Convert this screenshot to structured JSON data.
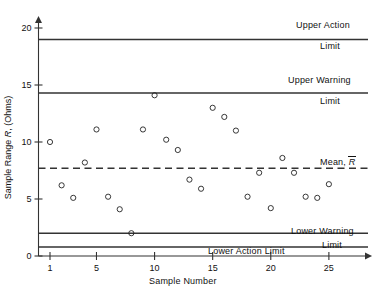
{
  "chart_data": {
    "type": "scatter",
    "title": "",
    "xlabel": "Sample Number",
    "ylabel": "Sample Range R, (Ohms)",
    "ylabel_parts": {
      "prefix": "Sample Range ",
      "symbol": "R",
      "suffix": ", (Ohms)"
    },
    "xlim": [
      0,
      27
    ],
    "ylim": [
      0,
      21
    ],
    "xticks": [
      1,
      5,
      10,
      15,
      20,
      25
    ],
    "yticks": [
      0,
      5,
      10,
      15,
      20
    ],
    "grid": false,
    "legend": false,
    "marker": "open-circle",
    "x": [
      1,
      2,
      3,
      4,
      5,
      6,
      7,
      8,
      9,
      10,
      11,
      12,
      13,
      14,
      15,
      16,
      17,
      18,
      19,
      20,
      21,
      22,
      23,
      24,
      25
    ],
    "values": [
      10.0,
      6.2,
      5.1,
      8.2,
      11.1,
      5.2,
      4.1,
      2.0,
      11.1,
      14.1,
      10.2,
      9.3,
      6.7,
      5.9,
      13.0,
      12.2,
      11.0,
      5.2,
      7.3,
      4.2,
      8.6,
      7.3,
      5.2,
      5.1,
      6.3
    ],
    "control_lines": [
      {
        "name": "upper-action-limit",
        "value": 19.0,
        "style": "solid",
        "label_line1": "Upper Action",
        "label_line2": "Limit"
      },
      {
        "name": "upper-warning-limit",
        "value": 14.3,
        "style": "solid",
        "label_line1": "Upper Warning",
        "label_line2": "Limit"
      },
      {
        "name": "mean-line",
        "value": 7.7,
        "style": "dashed",
        "label_line1": "Mean,",
        "label_symbol": "R",
        "label_line2": ""
      },
      {
        "name": "lower-warning-limit",
        "value": 2.0,
        "style": "solid",
        "label_line1": "Lower Warning",
        "label_line2": "Limit"
      },
      {
        "name": "lower-action-limit",
        "value": 0.8,
        "style": "solid",
        "label_line1": "Lower Action Limit",
        "label_line2": ""
      }
    ]
  },
  "labels": {
    "upper_action_l1": "Upper Action",
    "upper_action_l2": "Limit",
    "upper_warning_l1": "Upper Warning",
    "upper_warning_l2": "Limit",
    "mean_text": "Mean,",
    "mean_symbol": "R",
    "lower_warning_l1": "Lower Warning",
    "lower_warning_l2": "Limit",
    "lower_action": "Lower Action Limit",
    "xaxis_title": "Sample Number",
    "yaxis_prefix": "Sample Range",
    "yaxis_symbol": "R",
    "yaxis_suffix": ", (Ohms)"
  },
  "ticks": {
    "y": [
      "0",
      "5",
      "10",
      "15",
      "20"
    ],
    "x": [
      "1",
      "5",
      "10",
      "15",
      "20",
      "25"
    ]
  },
  "colors": {
    "line": "#333333",
    "marker": "#222222",
    "text": "#111111",
    "background": "#ffffff"
  }
}
